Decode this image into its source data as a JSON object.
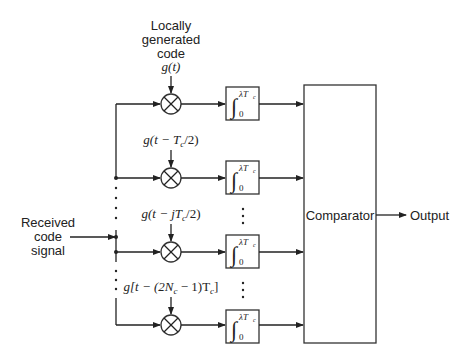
{
  "input": {
    "label_lines": [
      "Received",
      "code",
      "signal"
    ]
  },
  "local_code": {
    "label_lines": [
      "Locally",
      "generated",
      "code"
    ]
  },
  "branches": [
    {
      "reference": "g(t)",
      "integrator_upper": "λT",
      "integrator_sub": "c",
      "integrator_lower": "0"
    },
    {
      "reference": "g(t − T",
      "reference_sub": "c",
      "reference_tail": "/2)",
      "integrator_upper": "λT",
      "integrator_sub": "c",
      "integrator_lower": "0"
    },
    {
      "reference": "g(t − jT",
      "reference_sub": "c",
      "reference_tail": "/2)",
      "integrator_upper": "λT",
      "integrator_sub": "c",
      "integrator_lower": "0"
    },
    {
      "reference": "g[t − (2N",
      "reference_sub": "c",
      "reference_tail": " − 1)T",
      "reference_sub2": "c",
      "reference_end": "]",
      "integrator_upper": "λT",
      "integrator_sub": "c",
      "integrator_lower": "0"
    }
  ],
  "comparator": {
    "label": "Comparator"
  },
  "output": {
    "label": "Output"
  },
  "ellipsis": "⋮"
}
